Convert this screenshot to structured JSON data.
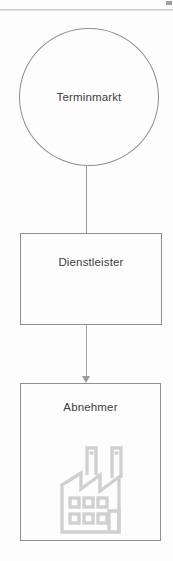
{
  "diagram": {
    "orientation": "vertical",
    "background_color": "#fdfdfd",
    "stroke_color": "#8f8f8f",
    "text_color": "#3d3d3d",
    "icon_color": "#d0d0d0",
    "nodes": [
      {
        "id": "terminmarkt",
        "label": "Terminmarkt",
        "shape": "circle"
      },
      {
        "id": "dienstleister",
        "label": "Dienstleister",
        "shape": "rectangle"
      },
      {
        "id": "abnehmer",
        "label": "Abnehmer",
        "shape": "rectangle",
        "icon": "factory-icon"
      }
    ],
    "connectors": [
      {
        "id": "terminmarkt-to-dienstleister",
        "from": "terminmarkt",
        "to": "dienstleister",
        "style": "line",
        "arrowhead": false
      },
      {
        "id": "dienstleister-to-abnehmer",
        "from": "dienstleister",
        "to": "abnehmer",
        "style": "line",
        "arrowhead": true
      }
    ]
  }
}
